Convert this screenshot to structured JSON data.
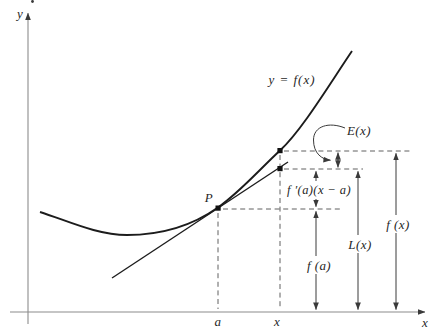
{
  "figure": {
    "colors": {
      "background": "#ffffff",
      "curve_ink": "#1c1c1c",
      "axis_gray": "#8c8c8c",
      "dash_gray": "#4f4f4f",
      "arrow_ink": "#3a3a3a",
      "label_ink": "#1f1f1f"
    },
    "labels": {
      "y_axis": "y",
      "x_axis": "x",
      "curve": "y = f(x)",
      "point_p": "P",
      "error": "E(x)",
      "tangent_rise": "f ′(a)(x − a)",
      "f_of_a": "f (a)",
      "l_of_x": "L(x)",
      "f_of_x": "f (x)",
      "tick_a": "a",
      "tick_x": "x"
    }
  }
}
